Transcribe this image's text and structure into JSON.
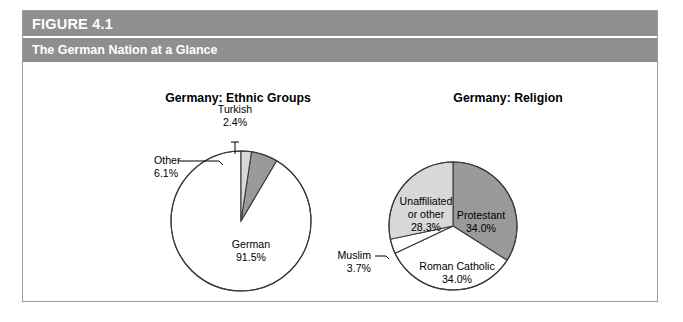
{
  "figure": {
    "label": "FIGURE 4.1",
    "title": "The German Nation at a Glance"
  },
  "colors": {
    "header_band": "#8f8f8f",
    "border": "#9b9b9b",
    "dark_gray_wedge": "#9a9a9a",
    "light_gray_wedge": "#d8d8d8",
    "white_wedge": "#ffffff",
    "outline": "#3a3a3a",
    "text": "#000000"
  },
  "chart_data": [
    {
      "type": "pie",
      "title": "Germany: Ethnic Groups",
      "categories": [
        "German",
        "Other",
        "Turkish"
      ],
      "values": [
        91.5,
        6.1,
        2.4
      ],
      "value_labels": [
        "91.5%",
        "6.1%",
        "2.4%"
      ],
      "slice_colors": [
        "#ffffff",
        "#9a9a9a",
        "#d8d8d8"
      ],
      "label_placement": [
        "inside",
        "outside-leader",
        "outside-tick"
      ],
      "units": "percent",
      "start_angle_deg": 0,
      "direction": "counterclockwise",
      "legend": "none",
      "grid": false,
      "labels": {
        "german_name": "German",
        "german_value": "91.5%",
        "other_name": "Other",
        "other_value": "6.1%",
        "turkish_name": "Turkish",
        "turkish_value": "2.4%"
      }
    },
    {
      "type": "pie",
      "title": "Germany: Religion",
      "categories": [
        "Protestant",
        "Roman Catholic",
        "Muslim",
        "Unaffiliated or other"
      ],
      "values": [
        34.0,
        34.0,
        3.7,
        28.3
      ],
      "value_labels": [
        "34.0%",
        "34.0%",
        "3.7%",
        "28.3%"
      ],
      "slice_colors": [
        "#9a9a9a",
        "#ffffff",
        "#ffffff",
        "#d8d8d8"
      ],
      "label_placement": [
        "inside",
        "inside",
        "outside-leader",
        "inside"
      ],
      "units": "percent",
      "start_angle_deg": 0,
      "direction": "clockwise",
      "legend": "none",
      "grid": false,
      "labels": {
        "protestant_name": "Protestant",
        "protestant_value": "34.0%",
        "catholic_name": "Roman Catholic",
        "catholic_value": "34.0%",
        "muslim_name": "Muslim",
        "muslim_value": "3.7%",
        "unaffiliated_line1": "Unaffiliated",
        "unaffiliated_line2": "or other",
        "unaffiliated_value": "28.3%"
      }
    }
  ]
}
